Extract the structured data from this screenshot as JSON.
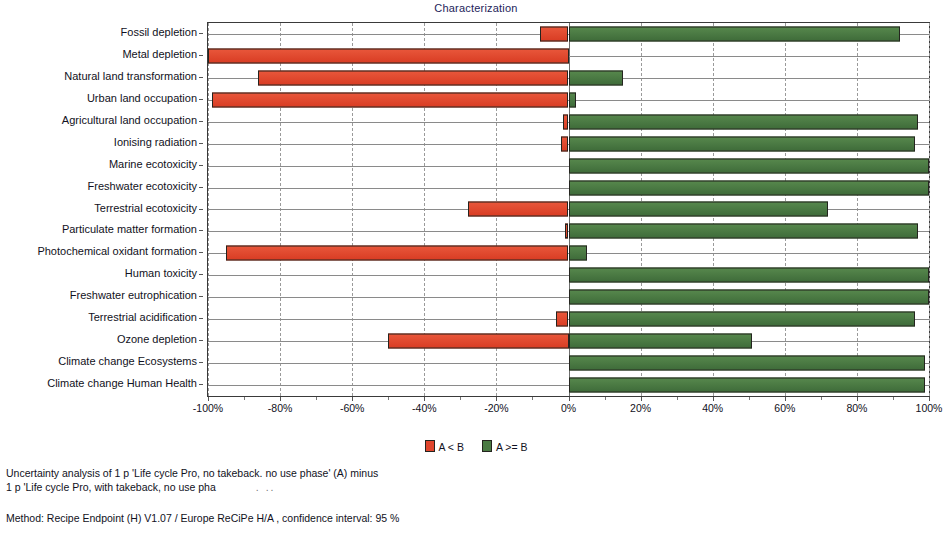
{
  "chart": {
    "title": "Characterization"
  },
  "legend": {
    "position": "bottom-center",
    "items": [
      {
        "label": "A < B",
        "color": "#e0452c",
        "key": "neg"
      },
      {
        "label": "A >= B",
        "color": "#4a7a43",
        "key": "pos"
      }
    ]
  },
  "footer": {
    "caption_line1": "Uncertainty analysis of 1 p 'Life cycle Pro, no takeback. no use phase' (A) minus",
    "caption_line2": "1 p 'Life cycle Pro, with takeback, no use pha",
    "caption_truncation": ". ..",
    "method": "Method: Recipe Endpoint (H) V1.07 / Europe ReCiPe H/A , confidence interval: 95 %"
  },
  "chart_data": {
    "type": "bar",
    "orientation": "horizontal",
    "title": "Characterization",
    "xlabel": "",
    "ylabel": "",
    "xlim": [
      -100,
      100
    ],
    "xticks": [
      -100,
      -80,
      -60,
      -40,
      -20,
      0,
      20,
      40,
      60,
      80,
      100
    ],
    "xtick_labels": [
      "-100%",
      "-80%",
      "-60%",
      "-40%",
      "-20%",
      "0%",
      "20%",
      "40%",
      "60%",
      "80%",
      "100%"
    ],
    "grid": true,
    "categories": [
      "Fossil depletion",
      "Metal depletion",
      "Natural land transformation",
      "Urban land occupation",
      "Agricultural land occupation",
      "Ionising radiation",
      "Marine ecotoxicity",
      "Freshwater ecotoxicity",
      "Terrestrial ecotoxicity",
      "Particulate matter formation",
      "Photochemical oxidant formation",
      "Human toxicity",
      "Freshwater eutrophication",
      "Terrestrial acidification",
      "Ozone depletion",
      "Climate change Ecosystems",
      "Climate change Human Health"
    ],
    "series": [
      {
        "name": "A < B",
        "color": "#e0452c",
        "values": [
          -8,
          -100,
          -86,
          -99,
          -1.5,
          -2,
          0,
          0,
          -28,
          -1,
          -95,
          0,
          0,
          -3.5,
          -50,
          0,
          0
        ]
      },
      {
        "name": "A >= B",
        "color": "#4a7a43",
        "values": [
          92,
          0,
          15,
          2,
          97,
          96,
          100,
          100,
          72,
          97,
          5,
          100,
          100,
          96,
          51,
          99,
          99
        ]
      }
    ]
  }
}
